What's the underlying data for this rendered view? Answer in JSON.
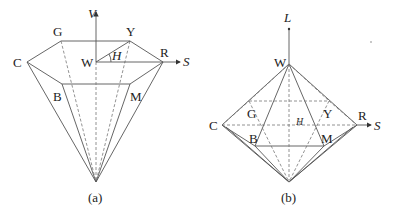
{
  "figure_a": {
    "caption": "(a)",
    "vertical_axis_label": "V",
    "horizontal_axis_label": "S",
    "angle_label": "H",
    "vertices": {
      "W": "W",
      "G": "G",
      "Y": "Y",
      "C": "C",
      "R": "R",
      "B": "B",
      "M": "M"
    }
  },
  "figure_b": {
    "caption": "(b)",
    "vertical_axis_label": "L",
    "horizontal_axis_label": "S",
    "angle_label": "H",
    "vertices": {
      "W": "W",
      "G": "G",
      "Y": "Y",
      "C": "C",
      "R": "R",
      "B": "B",
      "M": "M"
    }
  },
  "colors": {
    "line": "#555555",
    "text": "#222222",
    "background": "#ffffff"
  }
}
